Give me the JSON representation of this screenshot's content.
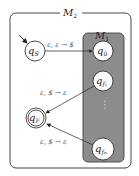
{
  "diagram": {
    "outer_machine": {
      "label": "M",
      "subscript": "2"
    },
    "inner_machine": {
      "label": "M",
      "subscript": "1",
      "fill": "#8c8c8c"
    },
    "states": {
      "start": {
        "label": "q",
        "subscript": "S",
        "initial": true
      },
      "q0": {
        "label": "q",
        "subscript": "0"
      },
      "qf1": {
        "label": "q",
        "subscript": "f₁"
      },
      "ellipsis": "⋮",
      "qfm": {
        "label": "q",
        "subscript": "fₘ"
      },
      "final": {
        "label": "q",
        "subscript": "F",
        "accepting": true
      }
    },
    "transitions": [
      {
        "from": "qS",
        "to": "q0",
        "label": "ε, ε → $"
      },
      {
        "from": "qf1",
        "to": "qF",
        "label": "ε, $ → ε"
      },
      {
        "from": "qfm",
        "to": "qF",
        "label": "ε, $ → ε"
      }
    ]
  }
}
